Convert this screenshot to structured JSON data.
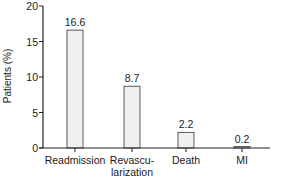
{
  "chart_data": {
    "type": "bar",
    "title": "",
    "xlabel": "",
    "ylabel": "Patients (%)",
    "ylim": [
      0,
      20
    ],
    "yticks": [
      0,
      5,
      10,
      15,
      20
    ],
    "grid": false,
    "legend": null,
    "categories": [
      "Readmission",
      "Revascularization",
      "Death",
      "MI"
    ],
    "category_labels_display": [
      [
        "Readmission"
      ],
      [
        "Revascu-",
        "larization"
      ],
      [
        "Death"
      ],
      [
        "MI"
      ]
    ],
    "values": [
      16.6,
      8.7,
      2.2,
      0.2
    ],
    "value_labels": [
      "16.6",
      "8.7",
      "2.2",
      "0.2"
    ],
    "bar_fill": "#f0f0f0",
    "bar_stroke": "#4a4a4a",
    "axis_color": "#222222"
  },
  "axis": {
    "ylabel": "Patients (%)",
    "yticks": [
      "0",
      "5",
      "10",
      "15",
      "20"
    ]
  },
  "bars": [
    {
      "category": "Readmission",
      "label_line1": "Readmission",
      "label_line2": "",
      "value_label": "16.6"
    },
    {
      "category": "Revascularization",
      "label_line1": "Revascu-",
      "label_line2": "larization",
      "value_label": "8.7"
    },
    {
      "category": "Death",
      "label_line1": "Death",
      "label_line2": "",
      "value_label": "2.2"
    },
    {
      "category": "MI",
      "label_line1": "MI",
      "label_line2": "",
      "value_label": "0.2"
    }
  ]
}
